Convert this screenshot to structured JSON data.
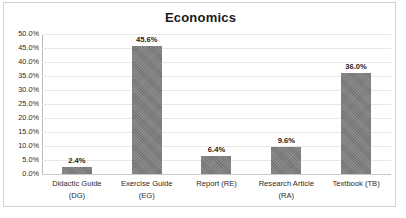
{
  "chart_data": {
    "type": "bar",
    "title": "Economics",
    "xlabel": "",
    "ylabel": "",
    "categories": [
      "Didactic Guide (DG)",
      "Exercise Guide (EG)",
      "Report (RE)",
      "Research Article (RA)",
      "Textbook (TB)"
    ],
    "category_lines": [
      [
        "Didactic Guide",
        "(DG)"
      ],
      [
        "Exercise Guide",
        "(EG)"
      ],
      [
        "Report (RE)"
      ],
      [
        "Research Article",
        "(RA)"
      ],
      [
        "Textbook (TB)"
      ]
    ],
    "values": [
      2.4,
      45.6,
      6.4,
      9.6,
      36.0
    ],
    "data_labels": [
      "2.4%",
      "45.6%",
      "6.4%",
      "9.6%",
      "36.0%"
    ],
    "ylim": [
      0,
      50
    ],
    "ytick_values": [
      0,
      5,
      10,
      15,
      20,
      25,
      30,
      35,
      40,
      45,
      50
    ],
    "ytick_labels": [
      "0.0%",
      "5.0%",
      "10.0%",
      "15.0%",
      "20.0%",
      "25.0%",
      "30.0%",
      "35.0%",
      "40.0%",
      "45.0%",
      "50.0%"
    ],
    "grid": true,
    "legend": false,
    "bar_color": "#7c7c7c",
    "gridline_color": "#e8e8e8",
    "axis_color": "#b9b9b9",
    "border_color": "#d2d2d2",
    "background_color": "#ffffff"
  }
}
